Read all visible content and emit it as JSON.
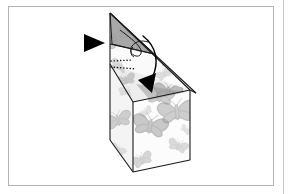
{
  "figure": {
    "caption": "",
    "style": "black-and-white line illustration",
    "background_color": "#ffffff",
    "frame": {
      "name": "page-border",
      "stroke_color": "#b4b4b4",
      "fill_color": "#ffffff",
      "x": 8,
      "y": 6,
      "width": 266,
      "height": 180
    },
    "gutter_rule": {
      "name": "page-gutter-rule",
      "stroke_color": "#c8c8c8",
      "x": 283,
      "y_start": 0,
      "y_end": 194
    },
    "line_color": "#1a1a1a",
    "fold_line_color": "#333333",
    "shade_color": "#d9d9d9",
    "pattern_color": "#b0b0b0",
    "pattern_color_dark": "#8f8f8f"
  },
  "annotations": {
    "pointer_triangle": {
      "label": "direction pointer",
      "shape": "solid-right-triangle",
      "color": "#000000",
      "x": 84,
      "y": 34,
      "width": 21,
      "height": 18
    },
    "curved_arrow": {
      "label": "fold flap inward and down",
      "color": "#000000",
      "head_x": 148,
      "head_y": 88
    },
    "fold_dotted_line": {
      "label": "fold here",
      "style": "dotted",
      "color": "#1a1a1a"
    }
  },
  "geometry": {
    "box_top_apex": [
      110,
      12
    ],
    "box_left_top": [
      110,
      17
    ],
    "box_left_bottom": [
      110,
      140
    ],
    "box_front_top": [
      133,
      102
    ],
    "box_front_bottom": [
      133,
      172
    ],
    "box_right_top": [
      190,
      90
    ],
    "box_right_bottom": [
      190,
      160
    ],
    "flap_right_tip": [
      196,
      93
    ]
  },
  "butterflies": [
    {
      "id": "b1",
      "x": 118,
      "y": 40,
      "size": 16,
      "rotation": -20,
      "opacity": 0.55
    },
    {
      "id": "b2",
      "x": 150,
      "y": 46,
      "size": 20,
      "rotation": 15,
      "opacity": 0.5
    },
    {
      "id": "b3",
      "x": 172,
      "y": 58,
      "size": 17,
      "rotation": -10,
      "opacity": 0.45
    },
    {
      "id": "b4",
      "x": 120,
      "y": 66,
      "size": 12,
      "rotation": 25,
      "opacity": 0.4
    },
    {
      "id": "b5",
      "x": 160,
      "y": 96,
      "size": 18,
      "rotation": 8,
      "opacity": 0.55
    },
    {
      "id": "b6",
      "x": 118,
      "y": 120,
      "size": 17,
      "rotation": -15,
      "opacity": 0.5
    },
    {
      "id": "b7",
      "x": 150,
      "y": 126,
      "size": 22,
      "rotation": 12,
      "opacity": 0.6
    },
    {
      "id": "b8",
      "x": 175,
      "y": 112,
      "size": 24,
      "rotation": -6,
      "opacity": 0.55
    },
    {
      "id": "b9",
      "x": 178,
      "y": 146,
      "size": 13,
      "rotation": 20,
      "opacity": 0.4
    },
    {
      "id": "b10",
      "x": 140,
      "y": 160,
      "size": 14,
      "rotation": -25,
      "opacity": 0.45
    },
    {
      "id": "b11",
      "x": 118,
      "y": 150,
      "size": 10,
      "rotation": 30,
      "opacity": 0.3
    },
    {
      "id": "b12",
      "x": 164,
      "y": 74,
      "size": 11,
      "rotation": -30,
      "opacity": 0.35
    }
  ]
}
